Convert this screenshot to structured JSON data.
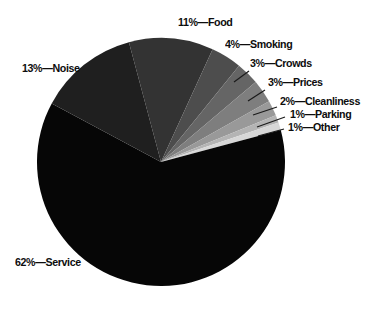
{
  "figure": {
    "background": "#ffffff",
    "text_color": "#0d0d0d",
    "leader_line_color": "#1a1a1a"
  },
  "chart_data": {
    "type": "pie",
    "title": "",
    "legend": "none",
    "units": "percent",
    "center": {
      "x": 161,
      "y": 162
    },
    "radius": 124,
    "start_angle_deg": 105,
    "direction": "clockwise",
    "categories": [
      "Food",
      "Smoking",
      "Crowds",
      "Prices",
      "Cleanliness",
      "Parking",
      "Other",
      "Service",
      "Noise"
    ],
    "values": [
      11,
      4,
      3,
      3,
      2,
      1,
      1,
      62,
      13
    ],
    "slices": [
      {
        "label": "Food",
        "value": 11,
        "color": "#333333",
        "text": "11%—Food",
        "label_pos": {
          "x": 178,
          "y": 17
        }
      },
      {
        "label": "Smoking",
        "value": 4,
        "color": "#4d4d4d",
        "text": "4%—Smoking",
        "label_pos": {
          "x": 225,
          "y": 39
        }
      },
      {
        "label": "Crowds",
        "value": 3,
        "color": "#656565",
        "text": "3%—Crowds",
        "label_pos": {
          "x": 250,
          "y": 58
        },
        "leader": {
          "x1": 249,
          "y1": 71,
          "x2": 234,
          "y2": 82
        }
      },
      {
        "label": "Prices",
        "value": 3,
        "color": "#7e7e7e",
        "text": "3%—Prices",
        "label_pos": {
          "x": 268,
          "y": 77
        },
        "leader": {
          "x1": 265,
          "y1": 90,
          "x2": 248,
          "y2": 101
        }
      },
      {
        "label": "Cleanliness",
        "value": 2,
        "color": "#999999",
        "text": "2%—Cleanliness",
        "label_pos": {
          "x": 280,
          "y": 96
        },
        "leader": {
          "x1": 277,
          "y1": 107,
          "x2": 253,
          "y2": 115
        }
      },
      {
        "label": "Parking",
        "value": 1,
        "color": "#b4b4b4",
        "text": "1%—Parking",
        "label_pos": {
          "x": 290,
          "y": 109
        },
        "leader": {
          "x1": 285,
          "y1": 117,
          "x2": 257,
          "y2": 127
        }
      },
      {
        "label": "Other",
        "value": 1,
        "color": "#d7d7d7",
        "text": "1%—Other",
        "label_pos": {
          "x": 288,
          "y": 122
        },
        "leader": {
          "x1": 284,
          "y1": 129,
          "x2": 258,
          "y2": 136
        }
      },
      {
        "label": "Service",
        "value": 62,
        "color": "#060606",
        "text": "62%—Service",
        "label_pos": {
          "x": 15,
          "y": 257
        }
      },
      {
        "label": "Noise",
        "value": 13,
        "color": "#1f1f1f",
        "text": "13%—Noise",
        "label_pos": {
          "x": 22,
          "y": 63
        }
      }
    ]
  }
}
